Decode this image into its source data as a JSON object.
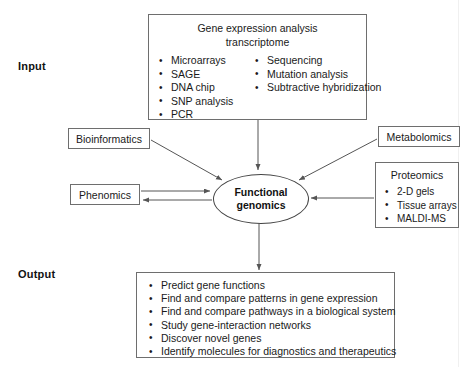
{
  "diagram": {
    "stage_labels": {
      "input": "Input",
      "output": "Output"
    },
    "center_node": {
      "name": "functional-genomics",
      "line1": "Functional",
      "line2": "genomics",
      "shape": "ellipse"
    },
    "input_box": {
      "title_line1": "Gene expression analysis",
      "title_line2": "transcriptome",
      "column_left": [
        "Microarrays",
        "SAGE",
        "DNA chip",
        "SNP analysis",
        "PCR"
      ],
      "column_right": [
        "Sequencing",
        "Mutation analysis",
        "Subtractive hybridization"
      ]
    },
    "side_nodes": {
      "bioinformatics": "Bioinformatics",
      "metabolomics": "Metabolomics",
      "phenomics": "Phenomics"
    },
    "proteomics_box": {
      "title": "Proteomics",
      "items": [
        "2-D gels",
        "Tissue arrays",
        "MALDI-MS"
      ]
    },
    "output_box": {
      "items": [
        "Predict gene functions",
        "Find and compare patterns in gene expression",
        "Find and compare pathways in a biological system",
        "Study gene-interaction networks",
        "Discover novel genes",
        "Identify molecules for diagnostics and therapeutics"
      ]
    },
    "colors": {
      "background": "#ffffff",
      "box_border": "#6e6e6e",
      "ellipse_border": "#444444",
      "connector": "#555555",
      "text": "#1a1a1a"
    },
    "connections": [
      {
        "from": "input_box",
        "to": "functional-genomics",
        "direction": "down"
      },
      {
        "from": "bioinformatics",
        "to": "functional-genomics",
        "direction": "diagonal-down-right"
      },
      {
        "from": "metabolomics",
        "to": "functional-genomics",
        "direction": "diagonal-down-left"
      },
      {
        "from": "proteomics",
        "to": "functional-genomics",
        "direction": "left"
      },
      {
        "from": "phenomics",
        "to": "functional-genomics",
        "direction": "right"
      },
      {
        "from": "functional-genomics",
        "to": "phenomics",
        "direction": "left"
      },
      {
        "from": "functional-genomics",
        "to": "output_box",
        "direction": "down"
      }
    ]
  }
}
